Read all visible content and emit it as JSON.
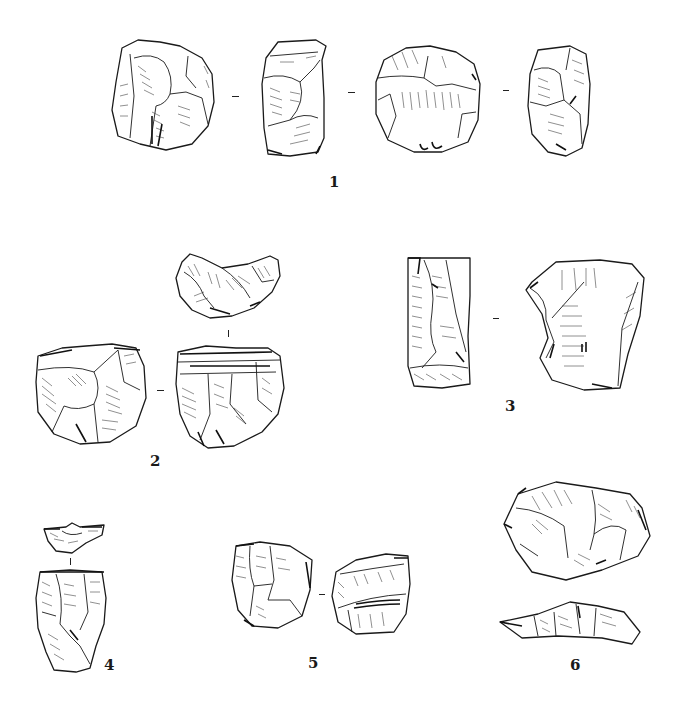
{
  "plate": {
    "background": "#ffffff",
    "ink_color": "#1a1a1a",
    "figures": [
      {
        "number": "1",
        "views": 4,
        "description": "core, four views"
      },
      {
        "number": "2",
        "views": 3,
        "description": "core, three views"
      },
      {
        "number": "3",
        "views": 2,
        "description": "core, two views"
      },
      {
        "number": "4",
        "views": 2,
        "description": "core, two views"
      },
      {
        "number": "5",
        "views": 2,
        "description": "core, two views"
      },
      {
        "number": "6",
        "views": 2,
        "description": "core, two views"
      }
    ]
  },
  "labels": {
    "fig1": "1",
    "fig2": "2",
    "fig3": "3",
    "fig4": "4",
    "fig5": "5",
    "fig6": "6"
  },
  "caption": {
    "text": ""
  }
}
